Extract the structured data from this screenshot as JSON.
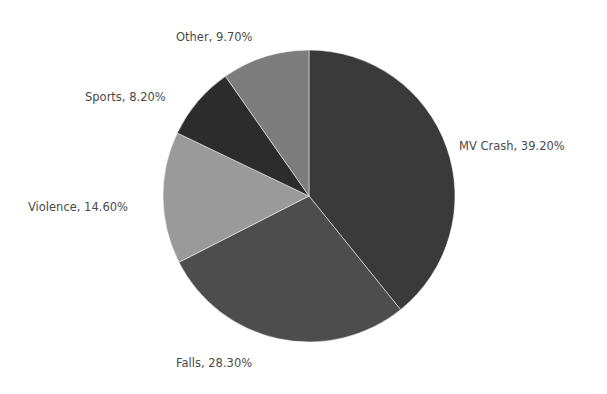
{
  "chart_data": {
    "type": "pie",
    "title": "",
    "start": "top",
    "direction": "clockwise",
    "legend": "none",
    "categories": [
      "MV Crash",
      "Falls",
      "Violence",
      "Sports",
      "Other"
    ],
    "values": [
      39.2,
      28.3,
      14.6,
      8.2,
      9.7
    ],
    "unit": "%",
    "labels": [
      "MV Crash, 39.20%",
      "Falls, 28.30%",
      "Violence, 14.60%",
      "Sports, 8.20%",
      "Other, 9.70%"
    ],
    "colors": [
      "#3a3a3a",
      "#4d4d4d",
      "#9a9a9a",
      "#2c2c2c",
      "#7d7d7d"
    ]
  }
}
